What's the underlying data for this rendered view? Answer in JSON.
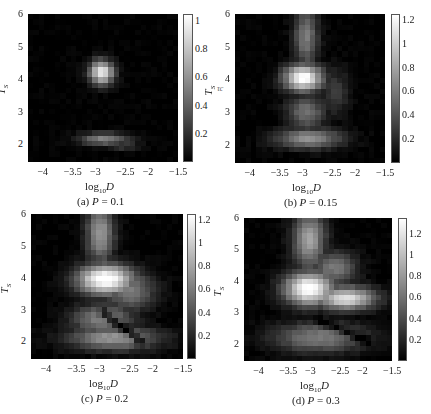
{
  "chart_data": [
    {
      "type": "heatmap",
      "caption": "(a) P = 0.1",
      "panel_label": "(a)",
      "param": "P = 0.1",
      "xlabel": "log10D",
      "ylabel": "T_S",
      "xlim": [
        -4.35,
        -1.5
      ],
      "ylim": [
        1.45,
        6
      ],
      "xticks": [
        "-4",
        "-3.5",
        "-3",
        "-2.5",
        "-2",
        "-1.5"
      ],
      "yticks": [
        "2",
        "3",
        "4",
        "5",
        "6"
      ],
      "colorbar": {
        "label": "τc",
        "range": [
          0,
          1.05
        ],
        "ticks": [
          "0.2",
          "0.4",
          "0.6",
          "0.8",
          "1"
        ],
        "colormap": "gray"
      },
      "blobs": [
        {
          "x": -2.95,
          "y": 4.2,
          "sx": 0.22,
          "sy": 0.35,
          "v": 1.0
        },
        {
          "x": -2.9,
          "y": 2.15,
          "sx": 0.45,
          "sy": 0.18,
          "v": 0.55
        },
        {
          "x": -2.55,
          "y": 1.95,
          "sx": 0.3,
          "sy": 0.12,
          "v": 0.3
        }
      ]
    },
    {
      "type": "heatmap",
      "caption": "(b) P = 0.15",
      "panel_label": "(b)",
      "param": "P = 0.15",
      "xlabel": "log10D",
      "ylabel": "T_S",
      "xlim": [
        -4.35,
        -1.5
      ],
      "ylim": [
        1.45,
        6
      ],
      "xticks": [
        "-4",
        "-3.5",
        "-3",
        "-2.5",
        "-2",
        "-1.5"
      ],
      "yticks": [
        "2",
        "3",
        "4",
        "5",
        "6"
      ],
      "colorbar": {
        "label": "",
        "range": [
          0,
          1.25
        ],
        "ticks": [
          "0.2",
          "0.4",
          "0.6",
          "0.8",
          "1",
          "1.2"
        ],
        "colormap": "gray"
      },
      "blobs": [
        {
          "x": -3.05,
          "y": 4.05,
          "sx": 0.35,
          "sy": 0.38,
          "v": 1.3
        },
        {
          "x": -3.0,
          "y": 5.3,
          "sx": 0.22,
          "sy": 0.9,
          "v": 0.6
        },
        {
          "x": -3.0,
          "y": 3.0,
          "sx": 0.35,
          "sy": 0.5,
          "v": 0.55
        },
        {
          "x": -2.95,
          "y": 2.2,
          "sx": 0.6,
          "sy": 0.3,
          "v": 0.7
        },
        {
          "x": -2.45,
          "y": 3.6,
          "sx": 0.25,
          "sy": 0.7,
          "v": 0.3
        }
      ]
    },
    {
      "type": "heatmap",
      "caption": "(c) P = 0.2",
      "panel_label": "(c)",
      "param": "P = 0.2",
      "xlabel": "log10D",
      "ylabel": "T_S",
      "xlim": [
        -4.35,
        -1.5
      ],
      "ylim": [
        1.45,
        6
      ],
      "xticks": [
        "-4",
        "-3.5",
        "-3",
        "-2.5",
        "-2",
        "-1.5"
      ],
      "yticks": [
        "2",
        "3",
        "4",
        "5",
        "6"
      ],
      "colorbar": {
        "label": "",
        "range": [
          0,
          1.25
        ],
        "ticks": [
          "0.2",
          "0.4",
          "0.6",
          "0.8",
          "1",
          "1.2"
        ],
        "colormap": "gray"
      },
      "blobs": [
        {
          "x": -2.95,
          "y": 3.95,
          "sx": 0.5,
          "sy": 0.45,
          "v": 1.35
        },
        {
          "x": -3.05,
          "y": 5.4,
          "sx": 0.25,
          "sy": 0.9,
          "v": 0.75
        },
        {
          "x": -2.5,
          "y": 3.6,
          "sx": 0.45,
          "sy": 0.6,
          "v": 0.6
        },
        {
          "x": -3.0,
          "y": 2.7,
          "sx": 0.55,
          "sy": 0.45,
          "v": 0.65
        },
        {
          "x": -2.8,
          "y": 2.1,
          "sx": 0.8,
          "sy": 0.35,
          "v": 0.75
        }
      ],
      "dark_diagonal": {
        "from": [
          -3.0,
          2.9
        ],
        "to": [
          -2.3,
          2.0
        ],
        "v": -0.5
      }
    },
    {
      "type": "heatmap",
      "caption": "(d) P = 0.3",
      "panel_label": "(d)",
      "param": "P = 0.3",
      "xlabel": "log10D",
      "ylabel": "T_S",
      "xlim": [
        -4.35,
        -1.5
      ],
      "ylim": [
        1.45,
        6
      ],
      "xticks": [
        "-4",
        "-3.5",
        "-3",
        "-2.5",
        "-2",
        "-1.5"
      ],
      "yticks": [
        "2",
        "3",
        "4",
        "5",
        "6"
      ],
      "colorbar": {
        "label": "",
        "range": [
          0,
          1.35
        ],
        "ticks": [
          "0.2",
          "0.4",
          "0.6",
          "0.8",
          "1",
          "1.2"
        ],
        "colormap": "gray"
      },
      "blobs": [
        {
          "x": -3.1,
          "y": 3.75,
          "sx": 0.45,
          "sy": 0.5,
          "v": 1.4
        },
        {
          "x": -2.4,
          "y": 3.45,
          "sx": 0.55,
          "sy": 0.35,
          "v": 1.2
        },
        {
          "x": -3.1,
          "y": 5.3,
          "sx": 0.3,
          "sy": 0.9,
          "v": 0.85
        },
        {
          "x": -2.6,
          "y": 4.4,
          "sx": 0.4,
          "sy": 0.5,
          "v": 0.65
        },
        {
          "x": -2.9,
          "y": 2.2,
          "sx": 0.85,
          "sy": 0.45,
          "v": 0.65
        }
      ],
      "dark_diagonal": {
        "from": [
          -2.9,
          2.7
        ],
        "to": [
          -2.0,
          2.1
        ],
        "v": -0.35
      }
    }
  ],
  "figure": {
    "panels": [
      {
        "caption_label": "(a)",
        "caption_var": "P",
        "caption_val": " = 0.1",
        "cb_label": "τc"
      },
      {
        "caption_label": "(b)",
        "caption_var": "P",
        "caption_val": " = 0.15",
        "cb_label": ""
      },
      {
        "caption_label": "(c)",
        "caption_var": "P",
        "caption_val": " = 0.2",
        "cb_label": ""
      },
      {
        "caption_label": "(d)",
        "caption_var": "P",
        "caption_val": " = 0.3",
        "cb_label": ""
      }
    ],
    "xlabel_log": "log",
    "xlabel_sub": "10",
    "xlabel_var": "D",
    "ylabel": "T",
    "ylabel_sub": "S"
  }
}
